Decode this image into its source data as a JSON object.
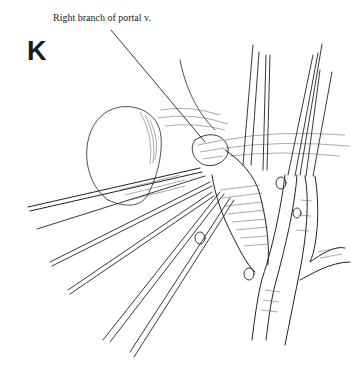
{
  "figure": {
    "panel_letter": "K",
    "annotations": [
      {
        "text": "Right branch of portal  v.",
        "leader_from": [
          111,
          30
        ],
        "leader_to": [
          205,
          142
        ]
      }
    ],
    "colors": {
      "background": "#ffffff",
      "line": "#222222"
    }
  }
}
